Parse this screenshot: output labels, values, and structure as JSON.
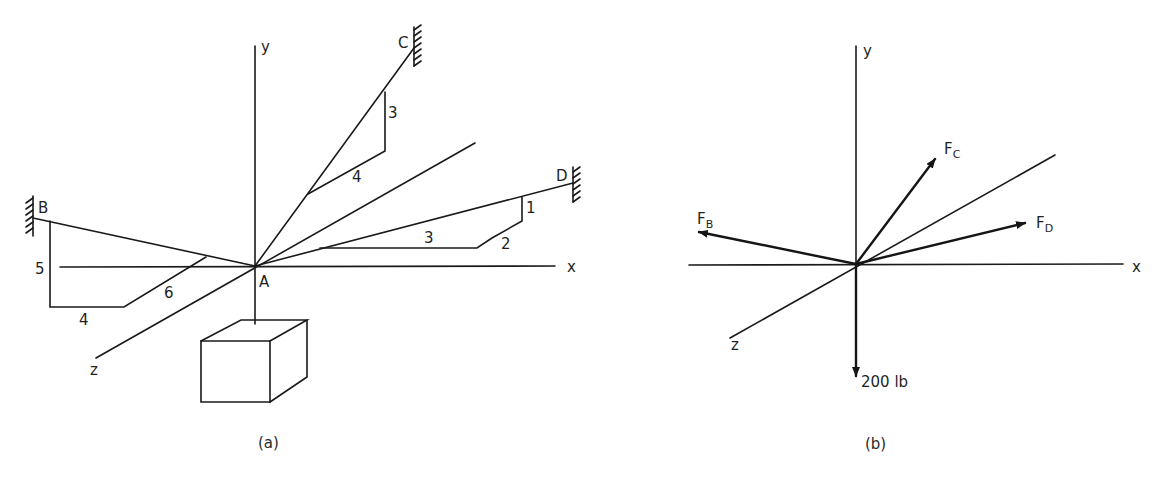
{
  "figure_a": {
    "caption": "(a)",
    "axes": {
      "x": "x",
      "y": "y",
      "z": "z"
    },
    "points": {
      "origin": "A",
      "support_b": "B",
      "support_c": "C",
      "support_d": "D"
    },
    "slope_ac": {
      "rise": "3",
      "run": "4"
    },
    "slope_ad": {
      "rise": "1",
      "run": "3",
      "depth": "2"
    },
    "slope_ab": {
      "rise": "5",
      "run": "4",
      "depth": "6"
    }
  },
  "figure_b": {
    "caption": "(b)",
    "axes": {
      "x": "x",
      "y": "y",
      "z": "z"
    },
    "forces": {
      "fb": {
        "main": "F",
        "sub": "B"
      },
      "fc": {
        "main": "F",
        "sub": "C"
      },
      "fd": {
        "main": "F",
        "sub": "D"
      }
    },
    "load": "200 lb"
  }
}
